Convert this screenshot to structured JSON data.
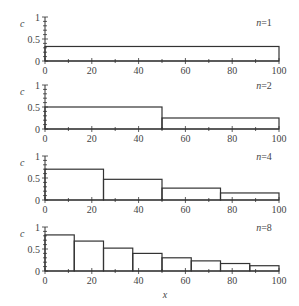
{
  "chart_data": [
    {
      "type": "step",
      "label": "n=1",
      "n": 1,
      "xlabel": "",
      "ylabel": "c",
      "xlim": [
        0,
        100
      ],
      "ylim": [
        0,
        1
      ],
      "xticks": [
        0,
        20,
        40,
        60,
        80,
        100
      ],
      "yticks": [
        0,
        0.5,
        1
      ],
      "edges": [
        0,
        100
      ],
      "values": [
        0.33
      ]
    },
    {
      "type": "step",
      "label": "n=2",
      "n": 2,
      "xlabel": "",
      "ylabel": "c",
      "xlim": [
        0,
        100
      ],
      "ylim": [
        0,
        1
      ],
      "xticks": [
        0,
        20,
        40,
        60,
        80,
        100
      ],
      "yticks": [
        0,
        0.5,
        1
      ],
      "edges": [
        0,
        50,
        100
      ],
      "values": [
        0.5,
        0.25
      ]
    },
    {
      "type": "step",
      "label": "n=4",
      "n": 4,
      "xlabel": "",
      "ylabel": "c",
      "xlim": [
        0,
        100
      ],
      "ylim": [
        0,
        1
      ],
      "xticks": [
        0,
        20,
        40,
        60,
        80,
        100
      ],
      "yticks": [
        0,
        0.5,
        1
      ],
      "edges": [
        0,
        25,
        50,
        75,
        100
      ],
      "values": [
        0.7,
        0.47,
        0.27,
        0.16
      ]
    },
    {
      "type": "step",
      "label": "n=8",
      "n": 8,
      "xlabel": "x",
      "ylabel": "c",
      "xlim": [
        0,
        100
      ],
      "ylim": [
        0,
        1
      ],
      "xticks": [
        0,
        20,
        40,
        60,
        80,
        100
      ],
      "yticks": [
        0,
        0.5,
        1
      ],
      "edges": [
        0,
        12.5,
        25,
        37.5,
        50,
        62.5,
        75,
        87.5,
        100
      ],
      "values": [
        0.82,
        0.68,
        0.52,
        0.4,
        0.3,
        0.23,
        0.17,
        0.12
      ]
    }
  ],
  "labels": {
    "ylabel": "c",
    "xlabel": "x",
    "ytick_labels": [
      "0",
      "0.5",
      "1"
    ],
    "xtick_labels": [
      "0",
      "20",
      "40",
      "60",
      "80",
      "100"
    ]
  },
  "colors": {
    "line": "#333333",
    "text": "#444444"
  }
}
